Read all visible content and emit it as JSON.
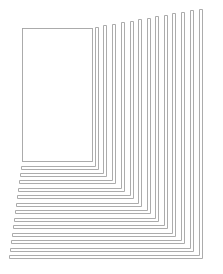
{
  "diagram": {
    "width": 223,
    "height": 274,
    "background": "#ffffff",
    "stroke_color": "#a3a3a3",
    "stroke_width": 0.9,
    "inner_rect": {
      "x": 22,
      "y": 28,
      "w": 70,
      "h": 133
    },
    "strip_thickness": 3,
    "strips": [
      {
        "x_right": 95,
        "y_top": 27,
        "y_bottom": 166,
        "x_left": 21
      },
      {
        "x_right": 103,
        "y_top": 25,
        "y_bottom": 173,
        "x_left": 20
      },
      {
        "x_right": 112,
        "y_top": 24,
        "y_bottom": 180,
        "x_left": 19
      },
      {
        "x_right": 121,
        "y_top": 22,
        "y_bottom": 188,
        "x_left": 18
      },
      {
        "x_right": 130,
        "y_top": 21,
        "y_bottom": 195,
        "x_left": 17
      },
      {
        "x_right": 138,
        "y_top": 19,
        "y_bottom": 203,
        "x_left": 16
      },
      {
        "x_right": 147,
        "y_top": 18,
        "y_bottom": 210,
        "x_left": 15
      },
      {
        "x_right": 155,
        "y_top": 16,
        "y_bottom": 218,
        "x_left": 14
      },
      {
        "x_right": 164,
        "y_top": 15,
        "y_bottom": 225,
        "x_left": 13
      },
      {
        "x_right": 172,
        "y_top": 13,
        "y_bottom": 233,
        "x_left": 12
      },
      {
        "x_right": 181,
        "y_top": 12,
        "y_bottom": 240,
        "x_left": 11
      },
      {
        "x_right": 190,
        "y_top": 10,
        "y_bottom": 248,
        "x_left": 10
      },
      {
        "x_right": 199,
        "y_top": 9,
        "y_bottom": 255,
        "x_left": 9
      }
    ]
  }
}
